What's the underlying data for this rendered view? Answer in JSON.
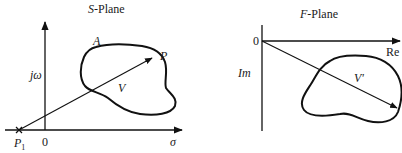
{
  "s_plane": {
    "title_italic": "S",
    "title_rest": "-Plane",
    "axis_x_label": "σ",
    "axis_y_label": "jω",
    "origin_label": "0",
    "point_p1_main": "P",
    "point_p1_sub": "1",
    "point_p_label": "P",
    "contour_label": "A",
    "vector_label": "V"
  },
  "f_plane": {
    "title_italic": "F",
    "title_rest": "-Plane",
    "axis_x_label": "Re",
    "axis_y_label": "Im",
    "origin_label": "0",
    "vector_label": "V'"
  },
  "colors": {
    "stroke": "#111111",
    "text": "#1a1a1a",
    "background": "#ffffff"
  }
}
